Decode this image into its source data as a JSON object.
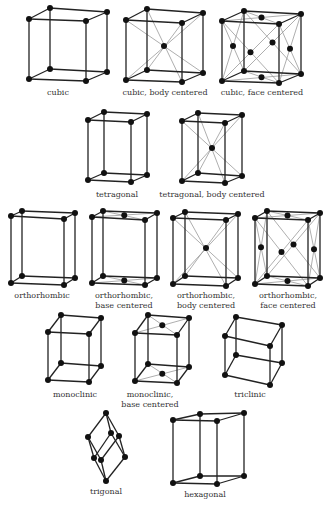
{
  "lattices": [
    {
      "id": "cubic",
      "label": "cubic",
      "label_pos": [
        58,
        88
      ],
      "F": [
        [
          29,
          19
        ],
        [
          86,
          21
        ],
        [
          86,
          81
        ],
        [
          29,
          79
        ]
      ],
      "B": [
        [
          50,
          8
        ],
        [
          107,
          12
        ],
        [
          107,
          72
        ],
        [
          50,
          69
        ]
      ],
      "centers": [],
      "diags": []
    },
    {
      "id": "cubic-bcc",
      "label": "cubic, body centered",
      "label_pos": [
        165,
        88
      ],
      "F": [
        [
          126,
          20
        ],
        [
          182,
          23
        ],
        [
          182,
          82
        ],
        [
          126,
          80
        ]
      ],
      "B": [
        [
          147,
          9
        ],
        [
          203,
          13
        ],
        [
          203,
          73
        ],
        [
          147,
          70
        ]
      ],
      "centers": [
        [
          164,
          46
        ]
      ],
      "diags": "body"
    },
    {
      "id": "cubic-fcc",
      "label": "cubic, face centered",
      "label_pos": [
        262,
        88
      ],
      "F": [
        [
          222,
          21
        ],
        [
          279,
          24
        ],
        [
          279,
          83
        ],
        [
          222,
          81
        ]
      ],
      "B": [
        [
          244,
          11
        ],
        [
          301,
          14
        ],
        [
          301,
          74
        ],
        [
          244,
          71
        ]
      ],
      "centers": "faces",
      "diags": "faces"
    },
    {
      "id": "tetragonal",
      "label": "tetragonal",
      "label_pos": [
        117,
        190
      ],
      "F": [
        [
          88,
          120
        ],
        [
          131,
          122
        ],
        [
          131,
          182
        ],
        [
          88,
          180
        ]
      ],
      "B": [
        [
          104,
          112
        ],
        [
          147,
          114
        ],
        [
          147,
          175
        ],
        [
          104,
          173
        ]
      ],
      "centers": [],
      "diags": []
    },
    {
      "id": "tetragonal-bcc",
      "label": "tetragonal, body centered",
      "label_pos": [
        212,
        190
      ],
      "F": [
        [
          182,
          121
        ],
        [
          225,
          123
        ],
        [
          225,
          183
        ],
        [
          182,
          181
        ]
      ],
      "B": [
        [
          198,
          113
        ],
        [
          242,
          115
        ],
        [
          242,
          176
        ],
        [
          198,
          173
        ]
      ],
      "centers": [
        [
          212,
          148
        ]
      ],
      "diags": "body"
    },
    {
      "id": "orthorhombic",
      "label": "orthorhombic",
      "label_pos": [
        42,
        291
      ],
      "F": [
        [
          11,
          216
        ],
        [
          64,
          219
        ],
        [
          64,
          285
        ],
        [
          11,
          283
        ]
      ],
      "B": [
        [
          22,
          211
        ],
        [
          75,
          213
        ],
        [
          75,
          278
        ],
        [
          22,
          276
        ]
      ],
      "centers": [],
      "diags": []
    },
    {
      "id": "orthorhombic-base",
      "label": "orthorhombic,\nbase centered",
      "label_pos": [
        124,
        291
      ],
      "F": [
        [
          92,
          217
        ],
        [
          145,
          220
        ],
        [
          145,
          285
        ],
        [
          92,
          283
        ]
      ],
      "B": [
        [
          103,
          211
        ],
        [
          157,
          213
        ],
        [
          157,
          278
        ],
        [
          103,
          276
        ]
      ],
      "centers": "base",
      "diags": "base"
    },
    {
      "id": "orthorhombic-body",
      "label": "orthorhombic,\nbody centered",
      "label_pos": [
        206,
        291
      ],
      "F": [
        [
          173,
          218
        ],
        [
          226,
          220
        ],
        [
          226,
          286
        ],
        [
          173,
          284
        ]
      ],
      "B": [
        [
          185,
          212
        ],
        [
          238,
          214
        ],
        [
          238,
          278
        ],
        [
          185,
          276
        ]
      ],
      "centers": [
        [
          206,
          248
        ]
      ],
      "diags": "body"
    },
    {
      "id": "orthorhombic-face",
      "label": "orthorhombic,\nface centered",
      "label_pos": [
        288,
        291
      ],
      "F": [
        [
          255,
          218
        ],
        [
          308,
          220
        ],
        [
          308,
          286
        ],
        [
          255,
          284
        ]
      ],
      "B": [
        [
          267,
          211
        ],
        [
          320,
          213
        ],
        [
          320,
          278
        ],
        [
          267,
          276
        ]
      ],
      "centers": "faces",
      "diags": "faces"
    },
    {
      "id": "monoclinic",
      "label": "monoclinic",
      "label_pos": [
        75,
        390
      ],
      "F": [
        [
          48,
          332
        ],
        [
          89,
          334
        ],
        [
          89,
          382
        ],
        [
          48,
          380
        ]
      ],
      "B": [
        [
          61,
          315
        ],
        [
          101,
          318
        ],
        [
          101,
          366
        ],
        [
          61,
          363
        ]
      ],
      "centers": [],
      "diags": []
    },
    {
      "id": "monoclinic-base",
      "label": "monoclinic,\nbase centered",
      "label_pos": [
        150,
        390
      ],
      "F": [
        [
          135,
          333
        ],
        [
          177,
          335
        ],
        [
          177,
          383
        ],
        [
          135,
          381
        ]
      ],
      "B": [
        [
          148,
          315
        ],
        [
          189,
          318
        ],
        [
          189,
          367
        ],
        [
          148,
          364
        ]
      ],
      "centers": "base",
      "diags": "base"
    },
    {
      "id": "triclinic",
      "label": "triclinic",
      "label_pos": [
        250,
        390
      ],
      "F": [
        [
          225,
          336
        ],
        [
          270,
          346
        ],
        [
          270,
          385
        ],
        [
          225,
          375
        ]
      ],
      "B": [
        [
          236,
          317
        ],
        [
          282,
          325
        ],
        [
          282,
          363
        ],
        [
          236,
          355
        ]
      ],
      "centers": [],
      "diags": []
    },
    {
      "id": "hexagonal",
      "label": "hexagonal",
      "label_pos": [
        205,
        490
      ],
      "F": [
        [
          173,
          420
        ],
        [
          217,
          421
        ],
        [
          217,
          484
        ],
        [
          173,
          483
        ]
      ],
      "B": [
        [
          200,
          414
        ],
        [
          244,
          413
        ],
        [
          244,
          476
        ],
        [
          200,
          476
        ]
      ],
      "centers": [],
      "diags": []
    }
  ],
  "trigonal": {
    "id": "trigonal",
    "label": "trigonal",
    "label_pos": [
      106,
      487
    ],
    "nodes": {
      "T": [
        106,
        413
      ],
      "A": [
        88,
        437
      ],
      "B": [
        111,
        433
      ],
      "C": [
        119,
        436
      ],
      "D": [
        94,
        458
      ],
      "E": [
        101,
        460
      ],
      "F": [
        125,
        457
      ],
      "Bt": [
        106,
        481
      ]
    },
    "edges": [
      [
        "T",
        "A"
      ],
      [
        "T",
        "B"
      ],
      [
        "T",
        "C"
      ],
      [
        "A",
        "D"
      ],
      [
        "A",
        "E"
      ],
      [
        "B",
        "D"
      ],
      [
        "B",
        "F"
      ],
      [
        "C",
        "E"
      ],
      [
        "C",
        "F"
      ],
      [
        "D",
        "Bt"
      ],
      [
        "E",
        "Bt"
      ],
      [
        "F",
        "Bt"
      ]
    ]
  }
}
